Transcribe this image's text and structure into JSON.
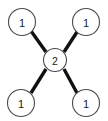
{
  "diagram": {
    "type": "node-link-graph",
    "shape": "star",
    "background_color": "#ffffff",
    "edge_color": "#111111",
    "node_fill_color": "#ffffff",
    "node_stroke_color": "#4a4a4a",
    "label_color": "#1a1a1a",
    "nodes": [
      {
        "id": "top-left",
        "label": "1",
        "cx": 22,
        "cy": 22,
        "r": 13.5
      },
      {
        "id": "top-right",
        "label": "1",
        "cx": 86,
        "cy": 22,
        "r": 13.5
      },
      {
        "id": "center",
        "label": "2",
        "cx": 55,
        "cy": 60,
        "r": 11.5
      },
      {
        "id": "bottom-left",
        "label": "1",
        "cx": 21,
        "cy": 103,
        "r": 13.5
      },
      {
        "id": "bottom-right",
        "label": "1",
        "cx": 86,
        "cy": 103,
        "r": 13.5
      }
    ],
    "edges": [
      {
        "id": "edge-center-top-left",
        "from": "center",
        "to": "top-left",
        "x1": 46,
        "y1": 52,
        "x2": 31,
        "y2": 31
      },
      {
        "id": "edge-center-top-right",
        "from": "center",
        "to": "top-right",
        "x1": 64,
        "y1": 52,
        "x2": 77,
        "y2": 32
      },
      {
        "id": "edge-center-bottom-left",
        "from": "center",
        "to": "bottom-left",
        "x1": 46,
        "y1": 69,
        "x2": 31,
        "y2": 93
      },
      {
        "id": "edge-center-bottom-right",
        "from": "center",
        "to": "bottom-right",
        "x1": 64,
        "y1": 69,
        "x2": 77,
        "y2": 93
      }
    ]
  }
}
